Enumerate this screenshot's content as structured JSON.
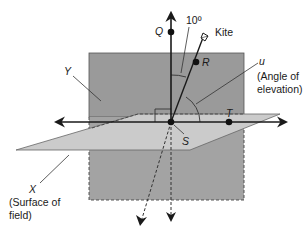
{
  "diagram": {
    "planes": {
      "vertical": {
        "name": "Y",
        "fill": "#9a9a9a"
      },
      "horizontal": {
        "name": "X",
        "description": "(Surface of field)",
        "fill": "#c8c8c8"
      }
    },
    "points": {
      "Q": "Q",
      "R": "R",
      "S": "S",
      "T": "T"
    },
    "labels": {
      "kite": "Kite",
      "angle_10": "10º",
      "u": "u",
      "angle_of_line1": "(Angle of",
      "angle_of_line2": "elevation)",
      "x": "X",
      "x_desc_line1": "(Surface of",
      "x_desc_line2": "field)",
      "y": "Y"
    },
    "colors": {
      "line": "#1a1a1a",
      "vertical_plane": "#9a9a9a",
      "horizontal_plane": "#c9c9c9",
      "dashed": "#333333"
    }
  }
}
